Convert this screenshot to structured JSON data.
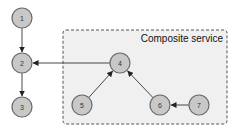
{
  "diagram": {
    "group": {
      "label": "Composite service",
      "fill": "#f0f0f0",
      "stroke": "#555555"
    },
    "nodes": [
      {
        "id": "1",
        "label": "1"
      },
      {
        "id": "2",
        "label": "2"
      },
      {
        "id": "3",
        "label": "3"
      },
      {
        "id": "4",
        "label": "4"
      },
      {
        "id": "5",
        "label": "5"
      },
      {
        "id": "6",
        "label": "6"
      },
      {
        "id": "7",
        "label": "7"
      }
    ],
    "edges": [
      {
        "from": "1",
        "to": "2"
      },
      {
        "from": "2",
        "to": "3"
      },
      {
        "from": "4",
        "to": "2"
      },
      {
        "from": "5",
        "to": "4"
      },
      {
        "from": "6",
        "to": "4"
      },
      {
        "from": "7",
        "to": "6"
      }
    ]
  }
}
